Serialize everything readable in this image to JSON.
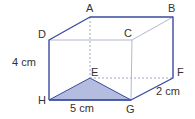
{
  "diagram": {
    "type": "cuboid",
    "vertices": {
      "A": {
        "label": "A",
        "x": 90,
        "y": 17
      },
      "B": {
        "label": "B",
        "x": 173,
        "y": 17
      },
      "C": {
        "label": "C",
        "x": 132,
        "y": 40
      },
      "D": {
        "label": "D",
        "x": 49,
        "y": 40
      },
      "E": {
        "label": "E",
        "x": 90,
        "y": 78
      },
      "F": {
        "label": "F",
        "x": 173,
        "y": 78
      },
      "G": {
        "label": "G",
        "x": 131,
        "y": 100
      },
      "H": {
        "label": "H",
        "x": 49,
        "y": 100
      }
    },
    "dimensions": {
      "height": "4 cm",
      "length": "5 cm",
      "width": "2 cm"
    },
    "shaded_region": "triangle EHG",
    "colors": {
      "edge": "#3b4aa0",
      "inner_edge": "#a8b0c8",
      "hidden_edge": "#8890b0",
      "fill": "#b4bde0"
    }
  }
}
